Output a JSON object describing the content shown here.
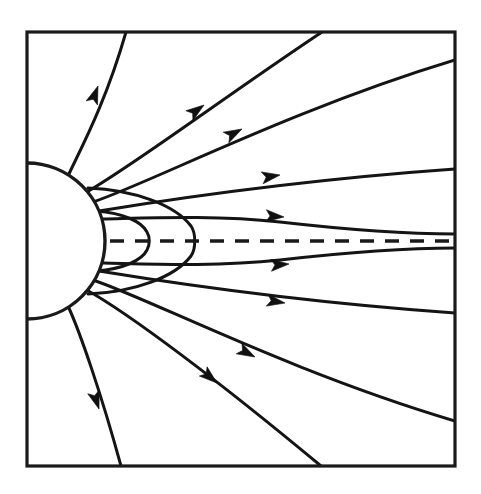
{
  "figure": {
    "kind": "line-diagram",
    "width": 481,
    "height": 494,
    "background_color": "#ffffff",
    "ink_color": "#141414"
  },
  "frame": {
    "name": "plot-border",
    "x": 27,
    "y": 32,
    "width": 428,
    "height": 434,
    "stroke_color": "#1a1a1a",
    "stroke_width": 3.2
  },
  "central_body": {
    "name": "central-sphere",
    "center_x": 27,
    "center_y": 241,
    "radius": 78,
    "fill_color": "#ffffff",
    "stroke_color": "#1a1a1a"
  },
  "axis": {
    "name": "symmetry-axis",
    "y": 241,
    "x_start": 110,
    "x_end": 455,
    "dash_pattern": "14 11",
    "stroke_color": "#1a1a1a"
  },
  "closed_loops": [
    {
      "name": "closed-loop-inner",
      "apex_x": 148,
      "top_y": 212,
      "bottom_y": 271,
      "foot_x": 96
    },
    {
      "name": "closed-loop-outer",
      "apex_x": 196,
      "top_y": 196,
      "bottom_y": 287,
      "foot_x": 88
    }
  ],
  "open_field_lines": [
    {
      "name": "fieldline-upper-1",
      "exit_edge": "top",
      "exit_pos": 126,
      "arrow_at": [
        97,
        86
      ]
    },
    {
      "name": "fieldline-upper-2",
      "exit_edge": "top",
      "exit_pos": 322,
      "arrow_at": [
        203,
        105
      ]
    },
    {
      "name": "fieldline-upper-3",
      "exit_edge": "right",
      "exit_pos": 60,
      "arrow_at": [
        241,
        129
      ]
    },
    {
      "name": "fieldline-upper-4",
      "exit_edge": "right",
      "exit_pos": 169,
      "arrow_at": [
        279,
        175
      ]
    },
    {
      "name": "fieldline-upper-5",
      "exit_edge": "right",
      "exit_pos": 233,
      "arrow_at": [
        283,
        216
      ]
    },
    {
      "name": "fieldline-lower-5",
      "exit_edge": "right",
      "exit_pos": 249,
      "arrow_at": [
        288,
        264
      ]
    },
    {
      "name": "fieldline-lower-4",
      "exit_edge": "right",
      "exit_pos": 313,
      "arrow_at": [
        284,
        303
      ]
    },
    {
      "name": "fieldline-lower-3",
      "exit_edge": "right",
      "exit_pos": 421,
      "arrow_at": [
        254,
        357
      ]
    },
    {
      "name": "fieldline-lower-2",
      "exit_edge": "bottom",
      "exit_pos": 321,
      "arrow_at": [
        216,
        383
      ]
    },
    {
      "name": "fieldline-lower-1",
      "exit_edge": "bottom",
      "exit_pos": 121,
      "arrow_at": [
        98,
        409
      ]
    }
  ],
  "arrow_count": 10,
  "arrow_direction": "outward-from-body"
}
